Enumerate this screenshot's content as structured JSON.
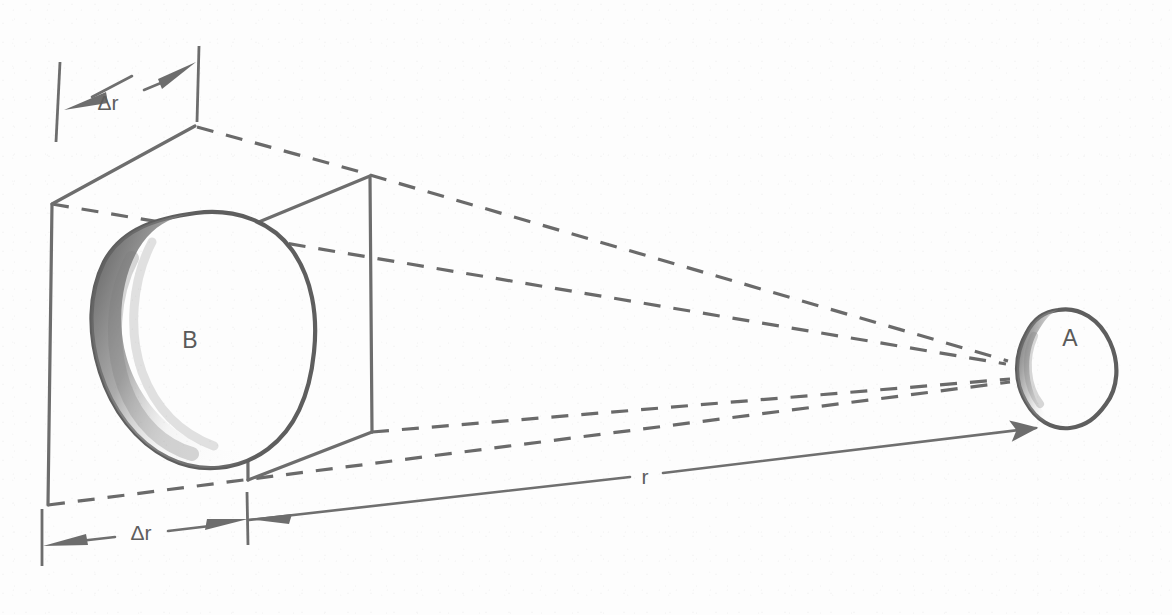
{
  "figure": {
    "background_color": "#fdfdfd",
    "ink_color": "#6d6d6d",
    "labels": {
      "object_a": "A",
      "object_b": "B",
      "distance_r": "r",
      "thickness_top": "Δr",
      "thickness_bottom": "Δr"
    },
    "annotations": [
      {
        "name": "delta-r-top",
        "text": "Δr",
        "x": 108,
        "y": 104,
        "description": "shell thickness measured along the top-front edge of the box"
      },
      {
        "name": "delta-r-bottom",
        "text": "Δr",
        "x": 140,
        "y": 534,
        "description": "shell thickness measured along the bottom-front edge of the box"
      },
      {
        "name": "distance-r",
        "text": "r",
        "x": 645,
        "y": 484,
        "description": "radial distance from the shell element to source A"
      },
      {
        "name": "object-a-label",
        "text": "A",
        "x": 1084,
        "y": 352,
        "description": "small irregular shaded body at right, the radiation source"
      },
      {
        "name": "object-b-label",
        "text": "B",
        "x": 190,
        "y": 341,
        "description": "large irregular shaded body inside the volume element"
      }
    ],
    "geometry": {
      "box_outer_face": {
        "name": "outer-front-face",
        "points": "52,204 195,126 370,175 372,432 248,480 48,505",
        "style": "mixed solid and dashed parallelepiped face"
      },
      "box_inner_face": {
        "name": "inner-back-face",
        "points": "195,126 370,175 372,432 248,480",
        "style": "solid"
      },
      "sight_lines": [
        {
          "name": "sight-line-top-back",
          "from": [
            370,
            175
          ],
          "to": [
            1012,
            362
          ],
          "style": "dashed"
        },
        {
          "name": "sight-line-top-front",
          "from": [
            52,
            204
          ],
          "to": [
            1012,
            364
          ],
          "style": "dashed"
        },
        {
          "name": "sight-line-bottom-back",
          "from": [
            372,
            432
          ],
          "to": [
            1014,
            380
          ],
          "style": "dashed"
        },
        {
          "name": "sight-line-bottom-front",
          "from": [
            48,
            505
          ],
          "to": [
            1014,
            382
          ],
          "style": "dashed"
        }
      ],
      "r_arrow": {
        "name": "r-distance-arrow",
        "from": [
          247,
          519
        ],
        "to": [
          1043,
          424
        ],
        "style": "solid double-headed"
      },
      "convergence_point": [
        1012,
        368
      ]
    },
    "shapes": {
      "object_a": {
        "name": "object-a",
        "center": [
          1068,
          368
        ],
        "approx_width": 96,
        "approx_height": 118,
        "shading": "left and bottom edges shaded dark"
      },
      "object_b": {
        "name": "object-b",
        "center": [
          188,
          340
        ],
        "approx_width": 200,
        "approx_height": 250,
        "shading": "left and bottom-left heavily shaded"
      }
    }
  }
}
